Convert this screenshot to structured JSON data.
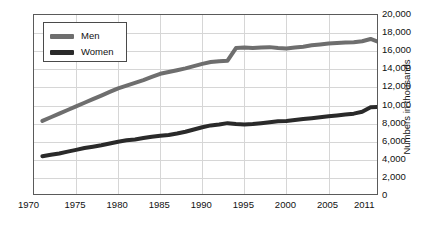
{
  "chart_data": {
    "type": "line",
    "title": "",
    "subtitle": "",
    "xlabel": "",
    "ylabel": "Numbers in thousands",
    "xlim": [
      1970,
      2011
    ],
    "ylim": [
      0,
      20000
    ],
    "grid": true,
    "legend_position": "top-left inside plot",
    "y_ticks": [
      0,
      2000,
      4000,
      6000,
      8000,
      10000,
      12000,
      14000,
      16000,
      18000,
      20000
    ],
    "y_tick_labels": [
      "0",
      "2,000",
      "4,000",
      "6,000",
      "8,000",
      "10,000",
      "12,000",
      "14,000",
      "16,000",
      "18,000",
      "20,000"
    ],
    "x_ticks": [
      1970,
      1975,
      1980,
      1985,
      1990,
      1995,
      2000,
      2005,
      2011
    ],
    "x_tick_labels": [
      "1970",
      "1975",
      "1980",
      "1985",
      "1990",
      "1995",
      "2000",
      "2005",
      "2011"
    ],
    "x": [
      1971,
      1972,
      1973,
      1974,
      1975,
      1976,
      1977,
      1978,
      1979,
      1980,
      1981,
      1982,
      1983,
      1984,
      1985,
      1986,
      1987,
      1988,
      1989,
      1990,
      1991,
      1992,
      1993,
      1994,
      1995,
      1996,
      1997,
      1998,
      1999,
      2000,
      2001,
      2002,
      2003,
      2004,
      2005,
      2006,
      2007,
      2008,
      2009,
      2010,
      2011
    ],
    "series": [
      {
        "name": "Men",
        "color": "#6e6e6e",
        "values": [
          8300,
          8700,
          9100,
          9500,
          9900,
          10300,
          10700,
          11100,
          11500,
          11900,
          12200,
          12500,
          12800,
          13150,
          13500,
          13700,
          13900,
          14100,
          14350,
          14600,
          14800,
          14900,
          14950,
          16350,
          16400,
          16350,
          16400,
          16450,
          16350,
          16300,
          16400,
          16500,
          16650,
          16750,
          16850,
          16900,
          16950,
          17000,
          17100,
          17350,
          17000
        ]
      },
      {
        "name": "Women",
        "color": "#2a2a2a",
        "values": [
          4400,
          4550,
          4700,
          4900,
          5100,
          5300,
          5450,
          5600,
          5800,
          6000,
          6150,
          6250,
          6400,
          6550,
          6650,
          6750,
          6900,
          7100,
          7350,
          7600,
          7800,
          7900,
          8050,
          7950,
          7900,
          7950,
          8050,
          8150,
          8250,
          8300,
          8400,
          8500,
          8600,
          8700,
          8800,
          8900,
          9000,
          9100,
          9300,
          9800,
          9850
        ]
      }
    ]
  },
  "legend": {
    "items": [
      {
        "label": "Men",
        "color": "#6e6e6e"
      },
      {
        "label": "Women",
        "color": "#2a2a2a"
      }
    ]
  },
  "axes": {
    "y_title": "Numbers in thousands"
  }
}
